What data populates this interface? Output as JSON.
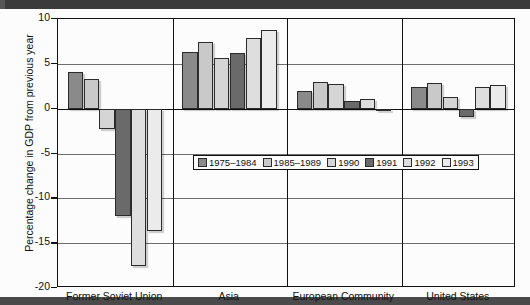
{
  "chart_data": {
    "type": "bar",
    "title": "",
    "subtitle": "",
    "xlabel": "",
    "ylabel": "Percentage change in GDP from previous year",
    "ylim": [
      -20,
      10
    ],
    "yticks": [
      10,
      5,
      0,
      -5,
      -10,
      -15,
      -20
    ],
    "ytick_labels": [
      "10",
      "5",
      "0",
      "-5",
      "-10",
      "-15",
      "-20"
    ],
    "grid": true,
    "legend_position": "center",
    "categories": [
      "Former Soviet Union",
      "Asia",
      "European Community",
      "United States"
    ],
    "series": [
      {
        "name": "1975–1984",
        "color": "#8a8a8a",
        "values": [
          4.1,
          6.3,
          2.0,
          2.4
        ]
      },
      {
        "name": "1985–1989",
        "color": "#c9c9c9",
        "values": [
          3.3,
          7.4,
          3.0,
          2.9
        ]
      },
      {
        "name": "1990",
        "color": "#d5d5d5",
        "values": [
          -2.3,
          5.7,
          2.8,
          1.3
        ]
      },
      {
        "name": "1991",
        "color": "#6a6a6a",
        "values": [
          -12.0,
          6.2,
          0.9,
          -0.9
        ]
      },
      {
        "name": "1992",
        "color": "#dedede",
        "values": [
          -17.5,
          7.9,
          1.1,
          2.4
        ]
      },
      {
        "name": "1993",
        "color": "#ebebeb",
        "values": [
          -13.7,
          8.8,
          -0.2,
          2.6
        ]
      }
    ]
  },
  "legend": {
    "items": [
      {
        "label": "1975–1984",
        "color": "#8a8a8a"
      },
      {
        "label": "1985–1989",
        "color": "#c9c9c9"
      },
      {
        "label": "1990",
        "color": "#d5d5d5"
      },
      {
        "label": "1991",
        "color": "#6a6a6a"
      },
      {
        "label": "1992",
        "color": "#dedede"
      },
      {
        "label": "1993",
        "color": "#ebebeb"
      }
    ]
  }
}
